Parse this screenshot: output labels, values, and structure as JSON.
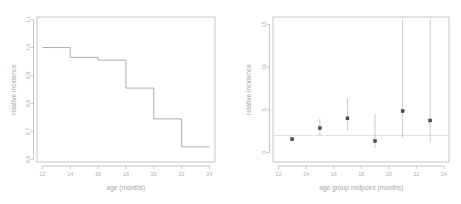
{
  "figure": {
    "background": "#ffffff",
    "line_color": "#9a9a9a",
    "text_color": "#b0b0b0",
    "point_color": "#4d4d4d",
    "panel_count": 2
  },
  "chart_data": [
    {
      "type": "line",
      "subtype": "step",
      "title": "",
      "xlabel": "age (months)",
      "ylabel": "relative incidence",
      "xlim": [
        11.5,
        24.5
      ],
      "ylim": [
        0.575,
        1.125
      ],
      "xticks": [
        12,
        14,
        16,
        18,
        20,
        22,
        24
      ],
      "xticklabels": [
        "12",
        "14",
        "16",
        "18",
        "20",
        "22",
        "24"
      ],
      "yticks": [
        0.6,
        0.7,
        0.8,
        0.9,
        1.0,
        1.1
      ],
      "yticklabels": [
        "0.6",
        "0.7",
        "0.8",
        "0.9",
        "1.0",
        "1.1"
      ],
      "grid": false,
      "legend": "none",
      "step_edges": [
        12,
        14,
        16,
        18,
        20,
        22,
        24
      ],
      "values": [
        1.0,
        0.965,
        0.955,
        0.855,
        0.745,
        0.645
      ],
      "x": [
        12,
        14,
        16,
        18,
        20,
        22
      ],
      "step_direction": "post"
    },
    {
      "type": "scatter",
      "subtype": "point-with-error-bars",
      "title": "",
      "xlabel": "age group midpoint (months)",
      "ylabel": "relative incidence",
      "xlim": [
        11.5,
        24.5
      ],
      "ylim": [
        -0.9,
        16.3
      ],
      "xticks": [
        12,
        14,
        16,
        18,
        20,
        22,
        24
      ],
      "xticklabels": [
        "12",
        "14",
        "16",
        "18",
        "20",
        "22",
        "24"
      ],
      "yticks": [
        0,
        5,
        10,
        15
      ],
      "yticklabels": [
        "0",
        "5",
        "10",
        "15"
      ],
      "grid": false,
      "legend": "none",
      "reference_line_y": 2.0,
      "x": [
        13,
        15,
        17,
        19,
        21,
        23
      ],
      "values": [
        1.55,
        2.85,
        4.0,
        1.35,
        4.85,
        3.75
      ],
      "err_low": [
        1.55,
        1.9,
        2.6,
        0.55,
        1.75,
        1.2
      ],
      "err_high": [
        1.55,
        3.95,
        6.3,
        4.5,
        15.6,
        15.6
      ]
    }
  ]
}
